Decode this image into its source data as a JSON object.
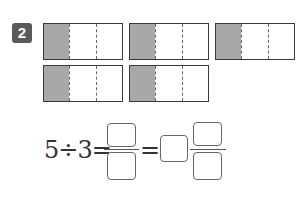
{
  "problem": {
    "number": "2",
    "badge_color": "#5a5a5a"
  },
  "bars": [
    {
      "parts": 3,
      "shaded": 1
    },
    {
      "parts": 3,
      "shaded": 1
    },
    {
      "parts": 3,
      "shaded": 1
    },
    {
      "parts": 3,
      "shaded": 1
    },
    {
      "parts": 3,
      "shaded": 1
    }
  ],
  "equation": {
    "expression": "5÷3=",
    "equals": "=",
    "answer_boxes": [
      "numerator",
      "denominator",
      "whole",
      "mixed-numerator",
      "mixed-denominator"
    ]
  },
  "colors": {
    "shade": "#a8a8a8",
    "border": "#3a3a3a"
  }
}
